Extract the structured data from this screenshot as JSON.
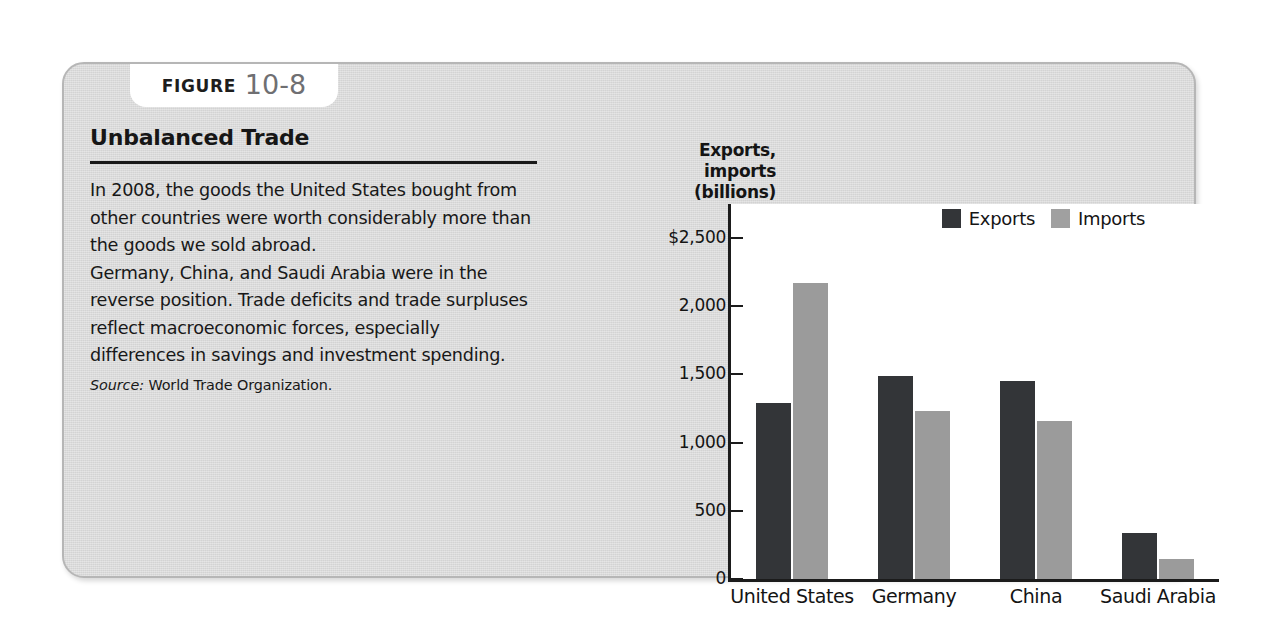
{
  "figure": {
    "tab_word": "FIGURE",
    "tab_number": "10-8",
    "title": "Unbalanced Trade",
    "body_paragraph_1": "In 2008, the goods the United States bought from other countries were worth considerably more than the goods we sold abroad.",
    "body_paragraph_2": "Germany, China, and Saudi Arabia were in the reverse position. Trade deficits and trade surpluses reflect macroeconomic forces, especially differences in savings and investment spending.",
    "source_label": "Source:",
    "source_text": "World Trade Organization."
  },
  "chart_data": {
    "type": "bar",
    "title": "Unbalanced Trade",
    "categories": [
      "United States",
      "Germany",
      "China",
      "Saudi Arabia"
    ],
    "series": [
      {
        "name": "Exports",
        "values": [
          1290,
          1490,
          1450,
          340
        ],
        "color": "#333538"
      },
      {
        "name": "Imports",
        "values": [
          2170,
          1230,
          1160,
          150
        ],
        "color": "#9b9b9b"
      }
    ],
    "xlabel": "",
    "ylabel": "Exports, imports (billions)",
    "ylabel_lines": [
      "Exports,",
      "imports",
      "(billions)"
    ],
    "ylim": [
      0,
      2750
    ],
    "yticks": [
      0,
      500,
      1000,
      1500,
      2000,
      2500
    ],
    "ytick_labels": [
      "0",
      "500",
      "1,000",
      "1,500",
      "2,000",
      "$2,500"
    ],
    "grid": false,
    "legend_position": "top-right",
    "legend": [
      "Exports",
      "Imports"
    ]
  },
  "colors": {
    "card_background": "#d9d9d9",
    "plot_background": "#ffffff",
    "exports_bar": "#333538",
    "imports_bar": "#9b9b9b",
    "axis": "#1b1b1b",
    "text": "#141414",
    "figure_number": "#6f6f72"
  }
}
